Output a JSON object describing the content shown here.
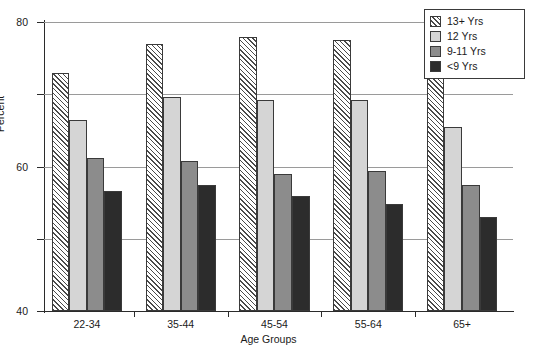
{
  "chart_data": {
    "type": "bar",
    "title": "",
    "xlabel": "Age Groups",
    "ylabel": "Percent",
    "categories": [
      "22-34",
      "35-44",
      "45-54",
      "55-64",
      "65+"
    ],
    "ylim": [
      0,
      80
    ],
    "yticks": [
      0,
      20,
      40,
      60,
      80
    ],
    "ytick_labels": [
      "0",
      "20",
      "40",
      "60",
      "80"
    ],
    "grid": "horizontal",
    "legend_position": "top-right",
    "series": [
      {
        "name": "13+ Yrs",
        "fill": "hatch-diagonal",
        "color": "#f2f2f2",
        "values": [
          66.0,
          74.0,
          75.8,
          75.0,
          68.4
        ]
      },
      {
        "name": "12 Yrs",
        "fill": "solid",
        "color": "#d5d5d5",
        "values": [
          52.8,
          59.3,
          58.5,
          58.3,
          51.0
        ]
      },
      {
        "name": "9-11 Yrs",
        "fill": "solid",
        "color": "#8c8c8c",
        "values": [
          42.4,
          41.4,
          37.8,
          38.8,
          35.0
        ]
      },
      {
        "name": "<9 Yrs",
        "fill": "solid",
        "color": "#2c2c2c",
        "values": [
          33.2,
          35.0,
          31.8,
          29.7,
          26.0
        ]
      }
    ]
  }
}
